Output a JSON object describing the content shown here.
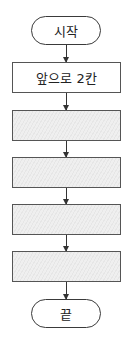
{
  "flowchart": {
    "start": "시작",
    "steps": [
      "앞으로 2칸",
      "",
      "",
      "",
      ""
    ],
    "end": "끝"
  }
}
